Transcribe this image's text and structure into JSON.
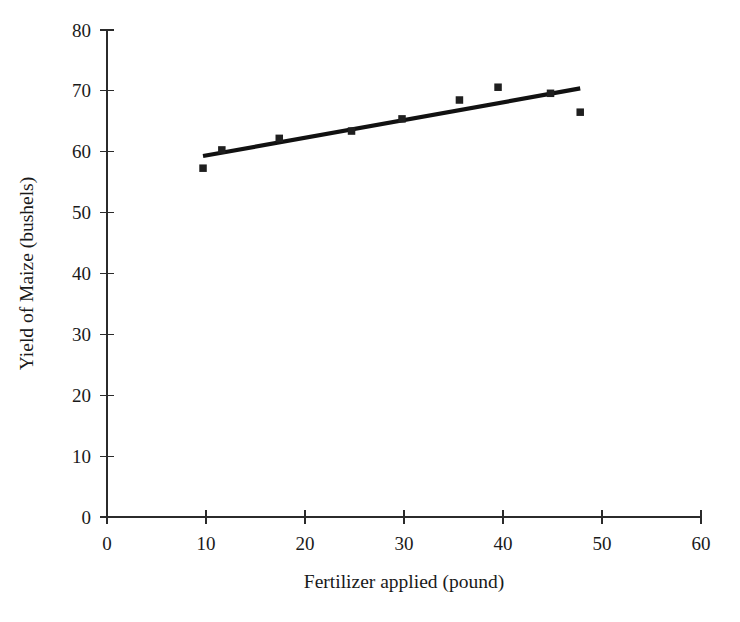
{
  "chart_data": {
    "type": "scatter",
    "title": "",
    "xlabel": "Fertilizer applied (pound)",
    "ylabel": "Yield of Maize (bushels)",
    "xlim": [
      0,
      60
    ],
    "ylim": [
      0,
      80
    ],
    "xticks": [
      0,
      10,
      20,
      30,
      40,
      50,
      60
    ],
    "yticks": [
      0,
      10,
      20,
      30,
      40,
      50,
      60,
      70,
      80
    ],
    "xtick_labels": [
      "0",
      "10",
      "20",
      "30",
      "40",
      "50",
      "60"
    ],
    "ytick_labels": [
      "0",
      "10",
      "20",
      "30",
      "40",
      "50",
      "60",
      "70",
      "80"
    ],
    "grid": false,
    "legend": false,
    "marker": "square",
    "marker_color": "#1f1f1f",
    "series": [
      {
        "name": "Maize yield observations",
        "type": "scatter",
        "x": [
          9.7,
          11.6,
          17.4,
          24.7,
          29.8,
          35.6,
          39.5,
          44.8,
          47.8
        ],
        "y": [
          57.3,
          60.3,
          62.2,
          63.4,
          65.4,
          68.5,
          70.6,
          69.6,
          66.5
        ]
      },
      {
        "name": "Linear trend line",
        "type": "line",
        "color": "#111111",
        "x": [
          9.7,
          47.8
        ],
        "y": [
          59.3,
          70.4
        ]
      }
    ]
  },
  "axes": {
    "x_title": "Fertilizer applied (pound)",
    "y_title": "Yield of Maize (bushels)"
  }
}
